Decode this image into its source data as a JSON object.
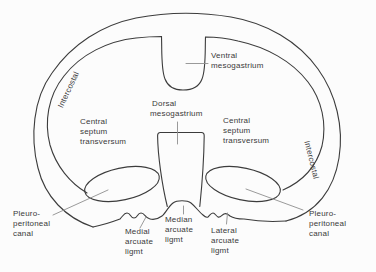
{
  "colors": {
    "background": "#fcfcfc",
    "line": "#3c3c3c",
    "leader": "#8f8f8f",
    "text": "#3a3a3a"
  },
  "labels": {
    "intercostal_left": {
      "text": "Intercostal"
    },
    "intercostal_right": {
      "text": "Intercostal"
    },
    "ventral_mesogastrium": {
      "lines": [
        "Ventral",
        "mesogastrium"
      ]
    },
    "dorsal_mesogastrium": {
      "lines": [
        "Dorsal",
        "mesogastrium"
      ]
    },
    "central_septum_left": {
      "lines": [
        "Central",
        "septum",
        "transversum"
      ]
    },
    "central_septum_right": {
      "lines": [
        "Central",
        "septum",
        "transversum"
      ]
    },
    "pleuro_peritoneal_left": {
      "lines": [
        "Pleuro-",
        "peritoneal",
        "canal"
      ]
    },
    "pleuro_peritoneal_right": {
      "lines": [
        "Pleuro-",
        "peritoneal",
        "canal"
      ]
    },
    "medial_arcuate": {
      "lines": [
        "Medial",
        "arcuate",
        "ligmt"
      ]
    },
    "median_arcuate": {
      "lines": [
        "Median",
        "arcuate",
        "ligmt"
      ]
    },
    "lateral_arcuate": {
      "lines": [
        "Lateral",
        "arcuate",
        "ligmt"
      ]
    }
  }
}
